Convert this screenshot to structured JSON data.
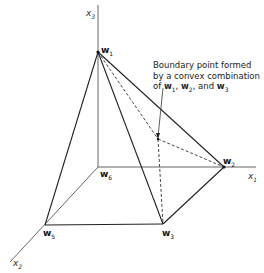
{
  "diagram": {
    "axes": {
      "x1": {
        "label": "x",
        "sub": "1"
      },
      "x2": {
        "label": "x",
        "sub": "2"
      },
      "x3": {
        "label": "x",
        "sub": "3"
      }
    },
    "vertices": {
      "w1": {
        "label": "w",
        "sub": "1"
      },
      "w2": {
        "label": "w",
        "sub": "2"
      },
      "w3": {
        "label": "w",
        "sub": "3"
      },
      "w5": {
        "label": "w",
        "sub": "5"
      },
      "w6": {
        "label": "w",
        "sub": "6"
      }
    },
    "annotation": {
      "line1": "Boundary point formed",
      "line2": "by a convex combination",
      "line3_prefix": "of ",
      "v1": "w",
      "v1_sub": "1",
      "sep1": ", ",
      "v2": "w",
      "v2_sub": "2",
      "sep2": ", and ",
      "v3": "w",
      "v3_sub": "3"
    }
  }
}
